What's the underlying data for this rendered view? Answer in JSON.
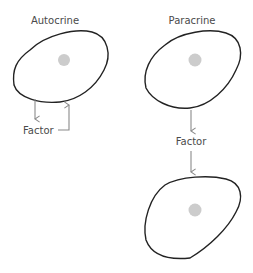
{
  "diagram": {
    "panels": [
      {
        "title": "Autocrine",
        "factor_label": "Factor"
      },
      {
        "title": "Paracrine",
        "factor_label": "Factor"
      }
    ],
    "colors": {
      "cell_outline": "#222222",
      "nucleus": "#cccccc",
      "arrow": "#8a8a8a",
      "text": "#4a4a4a"
    }
  }
}
